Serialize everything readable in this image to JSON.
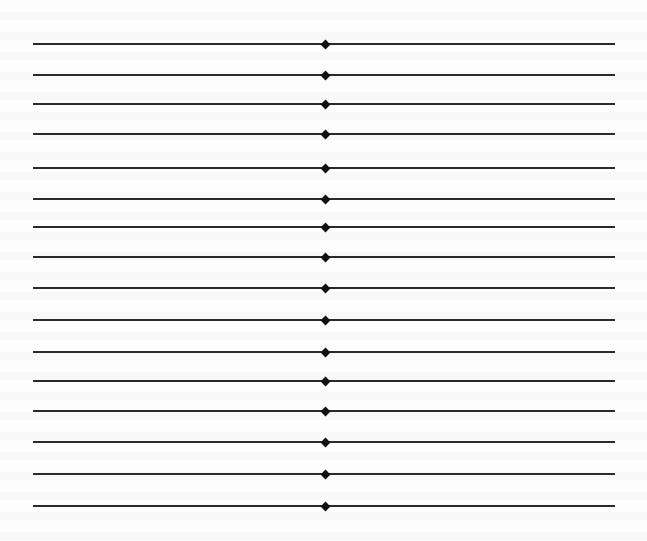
{
  "page": {
    "background": "#fdfdfd",
    "rule_color": "#2a2a2a",
    "marker_color": "#111111",
    "rule_x_start": 33,
    "rule_x_end": 615,
    "marker_x": 325,
    "marker_shape": "diamond",
    "rules": [
      {
        "y": 44
      },
      {
        "y": 75
      },
      {
        "y": 104
      },
      {
        "y": 134
      },
      {
        "y": 168
      },
      {
        "y": 199
      },
      {
        "y": 227
      },
      {
        "y": 257
      },
      {
        "y": 288
      },
      {
        "y": 320
      },
      {
        "y": 352
      },
      {
        "y": 381
      },
      {
        "y": 411
      },
      {
        "y": 442
      },
      {
        "y": 474
      },
      {
        "y": 506
      }
    ]
  }
}
